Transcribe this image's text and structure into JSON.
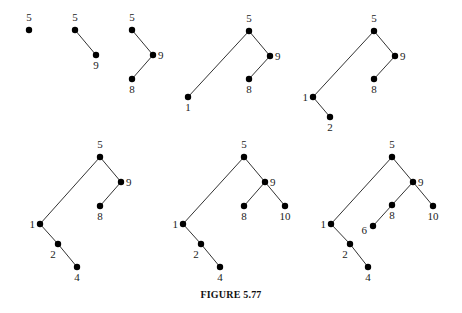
{
  "figure": {
    "caption": "FIGURE 5.77"
  },
  "trees": [
    {
      "id": "t1",
      "nodes": [
        {
          "label": "5",
          "x": 29,
          "y": 30,
          "lx": 29,
          "ly": 21,
          "anchor": "middle"
        }
      ],
      "edges": []
    },
    {
      "id": "t2",
      "nodes": [
        {
          "label": "5",
          "x": 75,
          "y": 30,
          "lx": 75,
          "ly": 21,
          "anchor": "middle"
        },
        {
          "label": "9",
          "x": 96,
          "y": 55,
          "lx": 96,
          "ly": 69,
          "anchor": "middle"
        }
      ],
      "edges": [
        [
          0,
          1
        ]
      ]
    },
    {
      "id": "t3",
      "nodes": [
        {
          "label": "5",
          "x": 132,
          "y": 30,
          "lx": 132,
          "ly": 21,
          "anchor": "middle"
        },
        {
          "label": "9",
          "x": 153,
          "y": 55,
          "lx": 158,
          "ly": 59,
          "anchor": "start"
        },
        {
          "label": "8",
          "x": 132,
          "y": 79,
          "lx": 132,
          "ly": 93,
          "anchor": "middle"
        }
      ],
      "edges": [
        [
          0,
          1
        ],
        [
          1,
          2
        ]
      ]
    },
    {
      "id": "t4",
      "nodes": [
        {
          "label": "5",
          "x": 249,
          "y": 31,
          "lx": 249,
          "ly": 22,
          "anchor": "middle"
        },
        {
          "label": "9",
          "x": 270,
          "y": 56,
          "lx": 275,
          "ly": 60,
          "anchor": "start"
        },
        {
          "label": "8",
          "x": 249,
          "y": 79,
          "lx": 249,
          "ly": 93,
          "anchor": "middle"
        },
        {
          "label": "1",
          "x": 188,
          "y": 97,
          "lx": 188,
          "ly": 111,
          "anchor": "middle"
        }
      ],
      "edges": [
        [
          0,
          1
        ],
        [
          1,
          2
        ],
        [
          0,
          3
        ]
      ]
    },
    {
      "id": "t5",
      "nodes": [
        {
          "label": "5",
          "x": 374,
          "y": 31,
          "lx": 374,
          "ly": 22,
          "anchor": "middle"
        },
        {
          "label": "9",
          "x": 395,
          "y": 56,
          "lx": 400,
          "ly": 60,
          "anchor": "start"
        },
        {
          "label": "8",
          "x": 374,
          "y": 79,
          "lx": 374,
          "ly": 93,
          "anchor": "middle"
        },
        {
          "label": "1",
          "x": 313,
          "y": 97,
          "lx": 308,
          "ly": 101,
          "anchor": "end"
        },
        {
          "label": "2",
          "x": 330,
          "y": 117,
          "lx": 330,
          "ly": 131,
          "anchor": "middle"
        }
      ],
      "edges": [
        [
          0,
          1
        ],
        [
          1,
          2
        ],
        [
          0,
          3
        ],
        [
          3,
          4
        ]
      ]
    },
    {
      "id": "t6",
      "nodes": [
        {
          "label": "5",
          "x": 100,
          "y": 157,
          "lx": 100,
          "ly": 148,
          "anchor": "middle"
        },
        {
          "label": "9",
          "x": 121,
          "y": 182,
          "lx": 126,
          "ly": 186,
          "anchor": "start"
        },
        {
          "label": "8",
          "x": 100,
          "y": 206,
          "lx": 100,
          "ly": 220,
          "anchor": "middle"
        },
        {
          "label": "1",
          "x": 40,
          "y": 224,
          "lx": 35,
          "ly": 228,
          "anchor": "end"
        },
        {
          "label": "2",
          "x": 58,
          "y": 244,
          "lx": 53,
          "ly": 258,
          "anchor": "middle"
        },
        {
          "label": "4",
          "x": 77,
          "y": 267,
          "lx": 77,
          "ly": 281,
          "anchor": "middle"
        }
      ],
      "edges": [
        [
          0,
          1
        ],
        [
          1,
          2
        ],
        [
          0,
          3
        ],
        [
          3,
          4
        ],
        [
          4,
          5
        ]
      ]
    },
    {
      "id": "t7",
      "nodes": [
        {
          "label": "5",
          "x": 244,
          "y": 157,
          "lx": 244,
          "ly": 148,
          "anchor": "middle"
        },
        {
          "label": "9",
          "x": 265,
          "y": 182,
          "lx": 270,
          "ly": 186,
          "anchor": "start"
        },
        {
          "label": "8",
          "x": 244,
          "y": 206,
          "lx": 244,
          "ly": 220,
          "anchor": "middle"
        },
        {
          "label": "10",
          "x": 285,
          "y": 206,
          "lx": 285,
          "ly": 220,
          "anchor": "middle"
        },
        {
          "label": "1",
          "x": 183,
          "y": 224,
          "lx": 178,
          "ly": 228,
          "anchor": "end"
        },
        {
          "label": "2",
          "x": 201,
          "y": 244,
          "lx": 196,
          "ly": 258,
          "anchor": "middle"
        },
        {
          "label": "4",
          "x": 220,
          "y": 267,
          "lx": 220,
          "ly": 281,
          "anchor": "middle"
        }
      ],
      "edges": [
        [
          0,
          1
        ],
        [
          1,
          2
        ],
        [
          1,
          3
        ],
        [
          0,
          4
        ],
        [
          4,
          5
        ],
        [
          5,
          6
        ]
      ]
    },
    {
      "id": "t8",
      "nodes": [
        {
          "label": "5",
          "x": 392,
          "y": 157,
          "lx": 392,
          "ly": 148,
          "anchor": "middle"
        },
        {
          "label": "9",
          "x": 413,
          "y": 182,
          "lx": 418,
          "ly": 186,
          "anchor": "start"
        },
        {
          "label": "8",
          "x": 392,
          "y": 205,
          "lx": 392,
          "ly": 219,
          "anchor": "middle"
        },
        {
          "label": "10",
          "x": 433,
          "y": 206,
          "lx": 433,
          "ly": 220,
          "anchor": "middle"
        },
        {
          "label": "6",
          "x": 373,
          "y": 226,
          "lx": 367,
          "ly": 234,
          "anchor": "end"
        },
        {
          "label": "1",
          "x": 331,
          "y": 224,
          "lx": 326,
          "ly": 228,
          "anchor": "end"
        },
        {
          "label": "2",
          "x": 350,
          "y": 244,
          "lx": 345,
          "ly": 258,
          "anchor": "middle"
        },
        {
          "label": "4",
          "x": 368,
          "y": 267,
          "lx": 368,
          "ly": 281,
          "anchor": "middle"
        }
      ],
      "edges": [
        [
          0,
          1
        ],
        [
          1,
          2
        ],
        [
          2,
          4
        ],
        [
          1,
          3
        ],
        [
          0,
          5
        ],
        [
          5,
          6
        ],
        [
          6,
          7
        ]
      ]
    }
  ]
}
